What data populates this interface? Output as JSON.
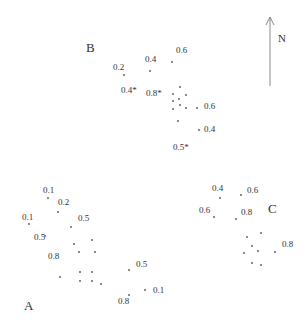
{
  "north_arrow": {
    "label": "N",
    "x": 270,
    "y_top": 17,
    "y_bottom": 86,
    "label_x": 278,
    "label_y": 33
  },
  "clusters": [
    {
      "name": "B",
      "label_x": 86,
      "label_y": 41,
      "values": [
        {
          "text": "0.2",
          "x": 113,
          "y": 63
        },
        {
          "text": "0.4",
          "x": 145,
          "y": 55
        },
        {
          "text": "0.6",
          "x": 176,
          "y": 46
        },
        {
          "text": "0.4*",
          "x": 121,
          "y": 86
        },
        {
          "text": "0.8*",
          "x": 146,
          "y": 89
        },
        {
          "text": "0.6",
          "x": 204,
          "y": 102
        },
        {
          "text": "0.4",
          "x": 204,
          "y": 125
        },
        {
          "text": "0.5*",
          "x": 173,
          "y": 143
        }
      ],
      "dots": [
        [
          124,
          75
        ],
        [
          150,
          71
        ],
        [
          172,
          62
        ],
        [
          180,
          87
        ],
        [
          173,
          94
        ],
        [
          186,
          95
        ],
        [
          173,
          101
        ],
        [
          179,
          99
        ],
        [
          180,
          105
        ],
        [
          186,
          108
        ],
        [
          173,
          109
        ],
        [
          197,
          108
        ],
        [
          178,
          121
        ],
        [
          199,
          130
        ]
      ]
    },
    {
      "name": "A",
      "label_x": 24,
      "label_y": 299,
      "values": [
        {
          "text": "0.1",
          "x": 43,
          "y": 186
        },
        {
          "text": "0.2",
          "x": 58,
          "y": 198
        },
        {
          "text": "0.1",
          "x": 22,
          "y": 213
        },
        {
          "text": "0.5",
          "x": 78,
          "y": 214
        },
        {
          "text": "0.5",
          "x": 34,
          "y": 233
        },
        {
          "text": "0.8",
          "x": 48,
          "y": 252
        },
        {
          "text": "0.5",
          "x": 136,
          "y": 260
        },
        {
          "text": "0.1",
          "x": 153,
          "y": 286
        },
        {
          "text": "0.8",
          "x": 118,
          "y": 297
        }
      ],
      "dots": [
        [
          48,
          198
        ],
        [
          58,
          212
        ],
        [
          29,
          224
        ],
        [
          71,
          227
        ],
        [
          45,
          236
        ],
        [
          74,
          244
        ],
        [
          92,
          240
        ],
        [
          79,
          252
        ],
        [
          95,
          252
        ],
        [
          60,
          277
        ],
        [
          80,
          272
        ],
        [
          92,
          272
        ],
        [
          80,
          281
        ],
        [
          92,
          281
        ],
        [
          101,
          284
        ],
        [
          129,
          270
        ],
        [
          145,
          290
        ],
        [
          129,
          295
        ]
      ]
    },
    {
      "name": "C",
      "label_x": 268,
      "label_y": 202,
      "values": [
        {
          "text": "0.4",
          "x": 212,
          "y": 184
        },
        {
          "text": "0.6",
          "x": 247,
          "y": 186
        },
        {
          "text": "0.6",
          "x": 199,
          "y": 206
        },
        {
          "text": "0.8",
          "x": 241,
          "y": 208
        },
        {
          "text": "0.8",
          "x": 282,
          "y": 240
        }
      ],
      "dots": [
        [
          220,
          198
        ],
        [
          241,
          195
        ],
        [
          214,
          217
        ],
        [
          236,
          219
        ],
        [
          247,
          237
        ],
        [
          261,
          233
        ],
        [
          252,
          246
        ],
        [
          244,
          253
        ],
        [
          258,
          251
        ],
        [
          275,
          252
        ],
        [
          252,
          263
        ],
        [
          261,
          265
        ]
      ]
    }
  ]
}
